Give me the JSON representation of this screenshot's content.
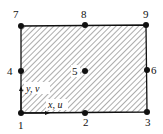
{
  "diagram": {
    "type": "nine-node quadrilateral element",
    "colors": {
      "stroke": "#111111",
      "hatch": "#555555",
      "background": "#ffffff"
    },
    "nodes": [
      {
        "id": "1",
        "label": "1",
        "x": 21,
        "y": 113,
        "lx": 18,
        "ly": 129
      },
      {
        "id": "2",
        "label": "2",
        "x": 85,
        "y": 113,
        "lx": 83,
        "ly": 126
      },
      {
        "id": "3",
        "label": "3",
        "x": 147,
        "y": 112,
        "lx": 145,
        "ly": 126
      },
      {
        "id": "4",
        "label": "4",
        "x": 21,
        "y": 71,
        "lx": 7,
        "ly": 75
      },
      {
        "id": "5",
        "label": "5",
        "x": 85,
        "y": 71,
        "lx": 72,
        "ly": 75
      },
      {
        "id": "6",
        "label": "6",
        "x": 147,
        "y": 70,
        "lx": 151,
        "ly": 74
      },
      {
        "id": "7",
        "label": "7",
        "x": 21,
        "y": 26,
        "lx": 13,
        "ly": 18
      },
      {
        "id": "8",
        "label": "8",
        "x": 85,
        "y": 25,
        "lx": 81,
        "ly": 18
      },
      {
        "id": "9",
        "label": "9",
        "x": 146,
        "y": 25,
        "lx": 143,
        "ly": 18
      }
    ],
    "axes": {
      "y_label": "y, v",
      "x_label": "x, u"
    }
  }
}
